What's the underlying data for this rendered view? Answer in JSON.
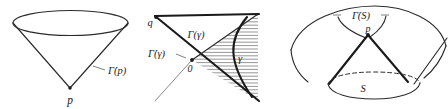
{
  "figure": {
    "caption_present": false,
    "background_color": "#ffffff",
    "ink_color": "#2b2b2b",
    "width": 448,
    "height": 109,
    "panel_count": 3
  },
  "panels": [
    {
      "id": "panel-left",
      "name": "future-cone-at-point",
      "shape": "downward cone with elliptical top rim and apex at bottom",
      "labels": {
        "apex": "p",
        "boundary": "Γ̇(p)"
      },
      "leader_lines": 1
    },
    {
      "id": "panel-middle",
      "name": "hatched-causal-wedge",
      "shape": "hatched triangular wedge bounded by two diagonals with a convex curve on the right",
      "labels": {
        "origin": "0",
        "upper_vertex": "q",
        "interior": "Γ(γ)",
        "boundary": "Γ̇(γ)",
        "curve": "γ"
      },
      "hatching": {
        "orientation": "horizontal",
        "line_count": 26,
        "color": "#545454"
      }
    },
    {
      "id": "panel-right",
      "name": "cone-over-surface",
      "shape": "cone with apex p over a dashed-rimmed elliptical base, enclosed by a large outer arc",
      "labels": {
        "apex": "p",
        "boundary": "Γ̇(S)",
        "base_surface": "S"
      },
      "leader_lines": 1
    }
  ],
  "symbols": {
    "gamma_upper": "Γ",
    "gamma_lower": "γ",
    "dot_accent": "˙",
    "point_p": "p",
    "point_q": "q",
    "surface_S": "S",
    "origin_0": "0"
  }
}
